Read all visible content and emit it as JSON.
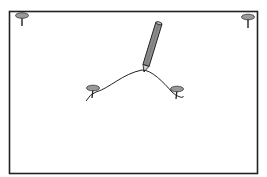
{
  "figure": {
    "colors": {
      "frame": "#222222",
      "pin_head": "#9a9a9a",
      "pin_outline": "#333333",
      "pencil_body": "#8c8c8c",
      "line": "#222222",
      "background": "#ffffff"
    },
    "elements": {
      "board": "board-frame",
      "pins": [
        "pin-top-left",
        "pin-top-right",
        "pin-middle-left",
        "pin-middle-right"
      ],
      "pencil": "pencil",
      "curve": "drawn-curve"
    }
  }
}
